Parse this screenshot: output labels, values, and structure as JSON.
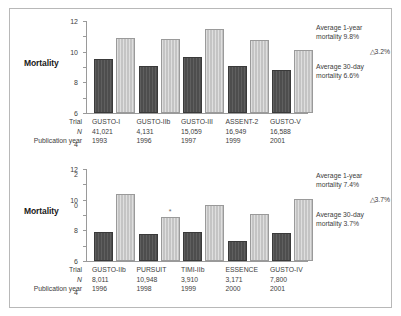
{
  "figure": {
    "axis_title": "Mortality",
    "row_headers": {
      "trial": "Trial",
      "n": "N",
      "year": "Publication year"
    },
    "marker_symbol": "*",
    "delta_symbol": "△"
  },
  "chart_data": [
    {
      "type": "bar",
      "id": "top-panel",
      "title": "",
      "xlabel": "",
      "ylabel": "Mortality",
      "ylim": [
        0,
        12
      ],
      "yticks": [
        0,
        2,
        4,
        6,
        8,
        10,
        12
      ],
      "grid": false,
      "legend_position": "none",
      "categories": [
        "GUSTO-I",
        "GUSTO-IIb",
        "GUSTO-III",
        "ASSENT-2",
        "GUSTO-V"
      ],
      "n_values": [
        "41,021",
        "4,131",
        "15,059",
        "16,949",
        "16,588"
      ],
      "publication_years": [
        "1993",
        "1996",
        "1997",
        "1999",
        "2001"
      ],
      "series": [
        {
          "name": "30-day mortality",
          "values": [
            7.0,
            6.1,
            7.3,
            6.1,
            5.6
          ]
        },
        {
          "name": "1-year mortality",
          "values": [
            9.8,
            9.6,
            11.0,
            9.5,
            8.2
          ]
        }
      ],
      "markers": [],
      "annotations": {
        "one_year_line1": "Average 1-year",
        "one_year_line2": "mortality 9.8%",
        "delta": "△3.2%",
        "thirty_day_line1": "Average 30-day",
        "thirty_day_line2": "mortality 6.6%"
      }
    },
    {
      "type": "bar",
      "id": "bottom-panel",
      "title": "",
      "xlabel": "",
      "ylabel": "Mortality",
      "ylim": [
        0,
        12
      ],
      "yticks": [
        0,
        2,
        4,
        6,
        8,
        10,
        12
      ],
      "grid": false,
      "legend_position": "none",
      "categories": [
        "GUSTO-IIb",
        "PURSUIT",
        "TIMI-IIb",
        "ESSENCE",
        "GUSTO-IV"
      ],
      "n_values": [
        "8,011",
        "10,948",
        "3,910",
        "3,171",
        "7,800"
      ],
      "publication_years": [
        "1996",
        "1998",
        "1999",
        "2000",
        "2001"
      ],
      "series": [
        {
          "name": "30-day mortality",
          "values": [
            3.8,
            3.5,
            3.8,
            2.6,
            3.7
          ]
        },
        {
          "name": "1-year mortality",
          "values": [
            8.7,
            5.8,
            7.3,
            6.1,
            8.1
          ]
        }
      ],
      "markers": [
        {
          "category": "PURSUIT",
          "series": "1-year mortality",
          "symbol": "*"
        }
      ],
      "annotations": {
        "one_year_line1": "Average 1-year",
        "one_year_line2": "mortality 7.4%",
        "delta": "△3.7%",
        "thirty_day_line1": "Average 30-day",
        "thirty_day_line2": "mortality 3.7%"
      }
    }
  ],
  "colors": {
    "bar_30day": "#4d4d4d",
    "bar_1year": "#c4c4c4",
    "axis": "#9a9a9a",
    "text": "#3d3d3d",
    "border": "#b8b8b8",
    "background": "#ffffff"
  }
}
